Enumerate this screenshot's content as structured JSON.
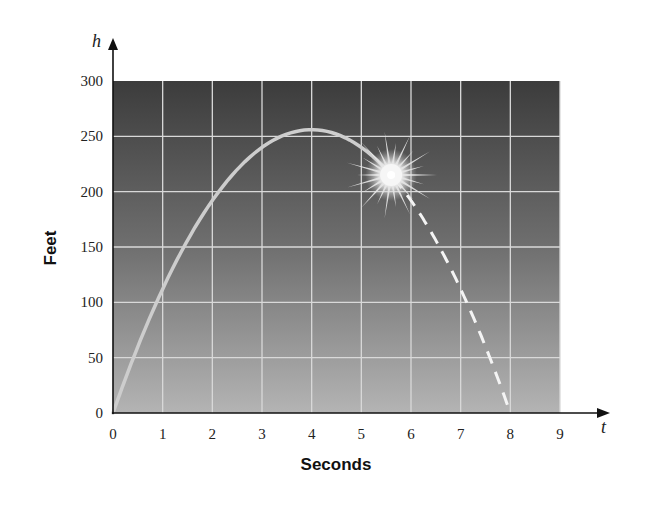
{
  "chart_data": {
    "type": "line",
    "title": "",
    "xlabel": "Seconds",
    "ylabel": "Feet",
    "x_axis_variable": "t",
    "y_axis_variable": "h",
    "xlim": [
      0,
      9
    ],
    "ylim": [
      0,
      300
    ],
    "x_ticks": [
      "0",
      "1",
      "2",
      "3",
      "4",
      "5",
      "6",
      "7",
      "8",
      "9"
    ],
    "y_ticks": [
      "0",
      "50",
      "100",
      "150",
      "200",
      "250",
      "300"
    ],
    "grid": true,
    "legend": null,
    "background": "vertical gradient dark gray (top) to light gray (bottom)",
    "series": [
      {
        "name": "Flight path (solid)",
        "style": "solid",
        "color": "#c8c8c8",
        "x": [
          0,
          0.5,
          1,
          1.5,
          2,
          2.5,
          3,
          3.5,
          4,
          4.5,
          5,
          5.5
        ],
        "values": [
          0,
          60,
          112,
          156,
          192,
          220,
          240,
          252,
          256,
          252,
          240,
          220
        ]
      },
      {
        "name": "Projected path (dashed)",
        "style": "dashed",
        "color": "#f0f0f0",
        "x": [
          5.5,
          6,
          6.5,
          7,
          7.5,
          8
        ],
        "values": [
          220,
          192,
          156,
          112,
          60,
          0
        ]
      }
    ],
    "annotations": [
      {
        "type": "starburst",
        "label": "explosion",
        "x": 5.6,
        "y": 215
      }
    ],
    "equation_implied": "h = 128t - 16t^2"
  },
  "labels": {
    "x_title": "Seconds",
    "y_title": "Feet",
    "x_var": "t",
    "y_var": "h"
  }
}
